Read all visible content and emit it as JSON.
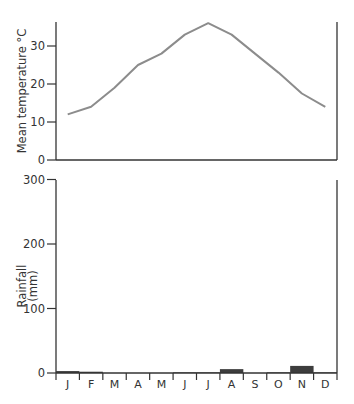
{
  "chart_data": [
    {
      "type": "line",
      "title": "",
      "xlabel": "",
      "ylabel": "Mean temperature °C",
      "categories": [
        "J",
        "F",
        "M",
        "A",
        "M",
        "J",
        "J",
        "A",
        "S",
        "O",
        "N",
        "D"
      ],
      "series": [
        {
          "name": "Mean temperature",
          "values": [
            12,
            14,
            19,
            25,
            28,
            33,
            36,
            33,
            28,
            23,
            17.5,
            14
          ]
        }
      ],
      "yticks": [
        0,
        10,
        20,
        30
      ],
      "ylim": [
        0,
        36
      ],
      "grid": false,
      "line_color": "#8c8c8c"
    },
    {
      "type": "bar",
      "title": "",
      "xlabel": "",
      "ylabel": "Rainfall (mm)",
      "categories": [
        "J",
        "F",
        "M",
        "A",
        "M",
        "J",
        "J",
        "A",
        "S",
        "O",
        "N",
        "D"
      ],
      "series": [
        {
          "name": "Rainfall",
          "values": [
            3,
            2,
            0,
            0,
            0,
            1,
            1,
            6,
            0,
            1,
            11,
            1
          ]
        }
      ],
      "yticks": [
        0,
        100,
        200,
        300
      ],
      "ylim": [
        0,
        300
      ],
      "grid": false,
      "bar_color": "#3d3d3d"
    }
  ],
  "labels": {
    "temp_axis_title": "Mean temperature °C",
    "rain_axis_title_line1": "Rainfall",
    "rain_axis_title_line2": "(mm)",
    "temp_ticks": [
      "0",
      "10",
      "20",
      "30"
    ],
    "rain_ticks": [
      "0",
      "100",
      "200",
      "300"
    ],
    "months": [
      "J",
      "F",
      "M",
      "A",
      "M",
      "J",
      "J",
      "A",
      "S",
      "O",
      "N",
      "D"
    ]
  }
}
